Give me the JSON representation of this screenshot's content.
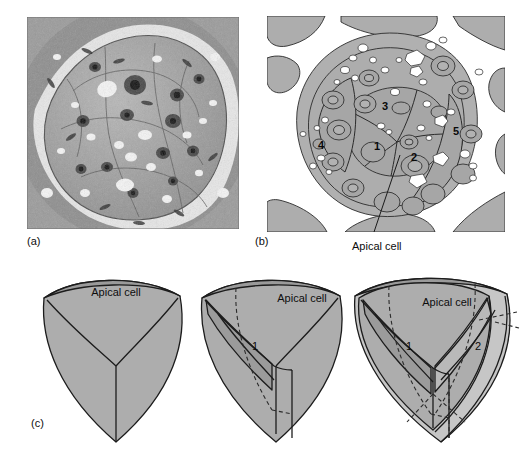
{
  "figure": {
    "type": "scientific-figure",
    "background": "#ffffff",
    "panels": [
      {
        "id": "a",
        "label": "(a)",
        "kind": "electron-micrograph",
        "description": "Transmission electron micrograph of a shoot apical meristem in transverse section, grayscale"
      },
      {
        "id": "b",
        "label": "(b)",
        "kind": "interpretive-line-drawing",
        "description": "Line-drawing tracing of the micrograph with numbered cell regions"
      },
      {
        "id": "c",
        "label": "(c)",
        "kind": "three-dimensional-diagram",
        "description": "Three tetrahedral/shield apical cell diagrams showing successive divisions"
      }
    ]
  },
  "panel_b": {
    "region_labels": [
      {
        "id": "1",
        "text": "1",
        "x": 377,
        "y": 146
      },
      {
        "id": "2",
        "text": "2",
        "x": 414,
        "y": 157
      },
      {
        "id": "3",
        "text": "3",
        "x": 385,
        "y": 106
      },
      {
        "id": "4",
        "text": "4",
        "x": 321,
        "y": 145
      },
      {
        "id": "5",
        "text": "5",
        "x": 456,
        "y": 131
      }
    ],
    "callout": {
      "text": "Apical cell",
      "leader_from": {
        "x": 400,
        "y": 155
      },
      "leader_to": {
        "x": 374,
        "y": 236
      }
    },
    "colors": {
      "cell_fill": "#a9a9a9",
      "outer_fill": "#b4b4b4",
      "vacuole": "#ffffff",
      "outline": "#2b2b2b"
    }
  },
  "panel_c": {
    "shields": [
      {
        "index": 1,
        "caption": "Apical cell",
        "numbers": [],
        "stage": "undivided apical cell"
      },
      {
        "index": 2,
        "caption": "Apical cell",
        "numbers": [
          "1"
        ],
        "stage": "after first division"
      },
      {
        "index": 3,
        "caption": "Apical cell",
        "numbers": [
          "1",
          "2"
        ],
        "stage": "after second division"
      }
    ],
    "colors": {
      "face_light": "#c9c9c9",
      "face_mid": "#adadad",
      "face_dark": "#9a9a9a",
      "outline": "#1c1c1c",
      "dashed": "#2b2b2b"
    }
  }
}
